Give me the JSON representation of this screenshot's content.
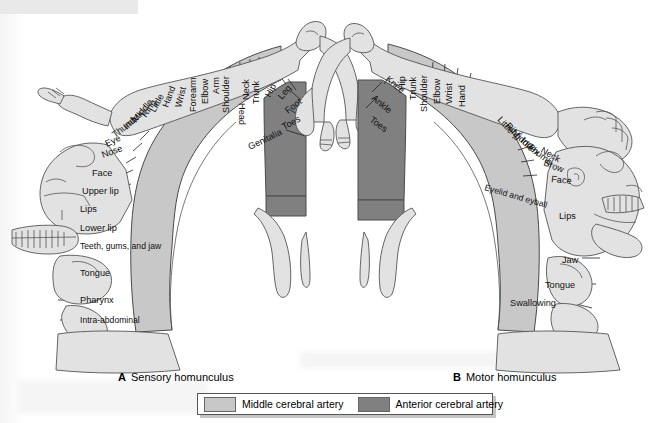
{
  "figure": {
    "colors": {
      "middle_cerebral_artery": "#c8c8c8",
      "anterior_cerebral_artery": "#808080",
      "body_outline_fill": "#d7d7d7",
      "stroke": "#4a4a4a",
      "text": "#111111",
      "page_background": "#ffffff"
    }
  },
  "captions": {
    "a": {
      "letter": "A",
      "text": "Sensory homunculus"
    },
    "b": {
      "letter": "B",
      "text": "Motor homunculus"
    }
  },
  "legend": {
    "items": [
      {
        "swatch_color": "#c8c8c8",
        "label": "Middle cerebral artery"
      },
      {
        "swatch_color": "#808080",
        "label": "Anterior cerebral artery"
      }
    ]
  },
  "sensory": {
    "panel_label": "A",
    "panel_name": "Sensory homunculus",
    "labels": [
      "Genitalia",
      "Toes",
      "Foot",
      "Leg",
      "Hip",
      "Trunk",
      "Neck",
      "Head",
      "Shoulder",
      "Arm",
      "Elbow",
      "Forearm",
      "Wrist",
      "Hand",
      "Little",
      "Ring",
      "Middle",
      "Index",
      "Thumb",
      "Eye",
      "Nose",
      "Face",
      "Upper lip",
      "Lips",
      "Lower lip",
      "Teeth, gums, and jaw",
      "Tongue",
      "Pharynx",
      "Intra-abdominal"
    ],
    "anterior_artery_labels": [
      "Genitalia",
      "Toes",
      "Foot",
      "Leg",
      "Hip"
    ],
    "vertical_labels": [
      {
        "text": "Forearm",
        "x": 196,
        "y": 112,
        "rot": -90
      },
      {
        "text": "Elbow",
        "x": 208,
        "y": 104,
        "rot": -90
      },
      {
        "text": "Arm",
        "x": 219,
        "y": 94,
        "rot": -90
      },
      {
        "text": "Shoulder",
        "x": 229,
        "y": 113,
        "rot": -90
      },
      {
        "text": "Head",
        "x": 239,
        "y": 103,
        "rot": 90
      },
      {
        "text": "Neck",
        "x": 249,
        "y": 100,
        "rot": -90
      },
      {
        "text": "Trunk",
        "x": 259,
        "y": 104,
        "rot": -90
      }
    ],
    "angled_labels": [
      {
        "text": "Hip",
        "x": 270,
        "y": 98,
        "rot": -62
      },
      {
        "text": "Leg",
        "x": 282,
        "y": 100,
        "rot": -50
      },
      {
        "text": "Foot",
        "x": 288,
        "y": 114,
        "rot": -38
      },
      {
        "text": "Toes",
        "x": 284,
        "y": 130,
        "rot": -28
      },
      {
        "text": "Genitalia",
        "x": 250,
        "y": 150,
        "rot": -26
      }
    ],
    "arc_labels": [
      {
        "text": "Wrist",
        "x": 181,
        "y": 108,
        "rot": -76
      },
      {
        "text": "Hand",
        "x": 168,
        "y": 108,
        "rot": -70
      },
      {
        "text": "Little",
        "x": 155,
        "y": 113,
        "rot": -62
      },
      {
        "text": "Ring",
        "x": 146,
        "y": 118,
        "rot": -56
      },
      {
        "text": "Middle",
        "x": 136,
        "y": 123,
        "rot": -50
      },
      {
        "text": "Index",
        "x": 127,
        "y": 130,
        "rot": -44
      },
      {
        "text": "Thumb",
        "x": 115,
        "y": 138,
        "rot": -38
      },
      {
        "text": "Eye",
        "x": 107,
        "y": 147,
        "rot": -26
      },
      {
        "text": "Nose",
        "x": 103,
        "y": 158,
        "rot": -20
      }
    ],
    "horizontal_labels": [
      {
        "text": "Face",
        "x": 92,
        "y": 176
      },
      {
        "text": "Upper lip",
        "x": 82,
        "y": 194
      },
      {
        "text": "Lips",
        "x": 80,
        "y": 212
      },
      {
        "text": "Lower lip",
        "x": 80,
        "y": 231
      },
      {
        "text": "Teeth, gums, and jaw",
        "x": 80,
        "y": 249
      },
      {
        "text": "Tongue",
        "x": 80,
        "y": 276
      },
      {
        "text": "Pharynx",
        "x": 80,
        "y": 303
      },
      {
        "text": "Intra-abdominal",
        "x": 80,
        "y": 323
      }
    ]
  },
  "motor": {
    "panel_label": "B",
    "panel_name": "Motor homunculus",
    "labels": [
      "Toes",
      "Ankle",
      "Knee",
      "Hip",
      "Trunk",
      "Shoulder",
      "Elbow",
      "Wrist",
      "Hand",
      "Little",
      "Ring",
      "Middle",
      "Index",
      "Thumb",
      "Neck",
      "Brow",
      "Eyelid and eyball",
      "Face",
      "Lips",
      "Jaw",
      "Tongue",
      "Swallowing"
    ],
    "anterior_artery_labels": [
      "Toes",
      "Ankle",
      "Knee"
    ],
    "angled_labels": [
      {
        "text": "Knee",
        "x": 385,
        "y": 80,
        "rot": 40
      },
      {
        "text": "Ankle",
        "x": 371,
        "y": 99,
        "rot": 40
      },
      {
        "text": "Toes",
        "x": 369,
        "y": 121,
        "rot": 36
      }
    ],
    "vertical_labels": [
      {
        "text": "Hip",
        "x": 405,
        "y": 90,
        "rot": -90
      },
      {
        "text": "Trunk",
        "x": 416,
        "y": 100,
        "rot": -90
      },
      {
        "text": "Shoulder",
        "x": 427,
        "y": 112,
        "rot": -90
      },
      {
        "text": "Elbow",
        "x": 440,
        "y": 104,
        "rot": -90
      },
      {
        "text": "Wrist",
        "x": 452,
        "y": 104,
        "rot": -90
      },
      {
        "text": "Hand",
        "x": 465,
        "y": 107,
        "rot": -90
      }
    ],
    "arc_labels": [
      {
        "text": "Little",
        "x": 497,
        "y": 120,
        "rot": 48
      },
      {
        "text": "Ring",
        "x": 505,
        "y": 126,
        "rot": 48
      },
      {
        "text": "Middle",
        "x": 511,
        "y": 133,
        "rot": 44
      },
      {
        "text": "Index",
        "x": 520,
        "y": 141,
        "rot": 42
      },
      {
        "text": "Thumb",
        "x": 527,
        "y": 148,
        "rot": 38
      },
      {
        "text": "Neck",
        "x": 540,
        "y": 152,
        "rot": 30
      },
      {
        "text": "Brow",
        "x": 543,
        "y": 165,
        "rot": 22
      },
      {
        "text": "Eyelid and eyball",
        "x": 484,
        "y": 190,
        "rot": 16
      },
      {
        "text": "Face",
        "x": 551,
        "y": 182,
        "rot": 6
      }
    ],
    "horizontal_labels": [
      {
        "text": "Lips",
        "x": 559,
        "y": 219
      },
      {
        "text": "Jaw",
        "x": 562,
        "y": 263
      },
      {
        "text": "Tongue",
        "x": 545,
        "y": 288
      },
      {
        "text": "Swallowing",
        "x": 510,
        "y": 306
      }
    ]
  }
}
